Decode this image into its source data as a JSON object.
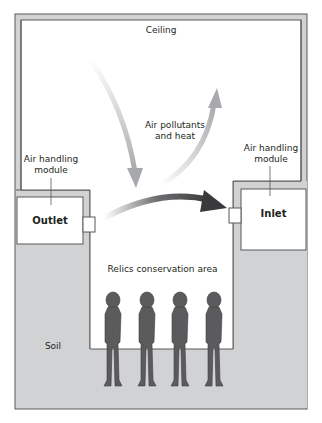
{
  "labels": {
    "ceiling": "Ceiling",
    "pollutants_line1": "Air pollutants",
    "pollutants_line2": "and heat",
    "left_module_line1": "Air handling",
    "left_module_line2": "module",
    "right_module_line1": "Air handling",
    "right_module_line2": "module",
    "outlet": "Outlet",
    "inlet": "Inlet",
    "area": "Relics conservation area",
    "soil": "Soil"
  },
  "colors": {
    "soil": "#d1d2d4",
    "frame_stroke": "#58595b",
    "figure": "#5b5b5d",
    "arrow_dark": "#3f3f41",
    "arrow_light": "#b6b7b9"
  },
  "figures_count": 4
}
